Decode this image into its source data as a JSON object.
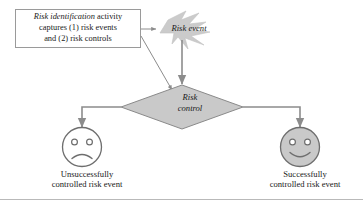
{
  "diagram": {
    "description_box": {
      "line1_italic": "Risk identification",
      "line1_rest": " activity",
      "line2": "captures (1) risk events",
      "line3": "and (2) risk controls"
    },
    "risk_event": {
      "label": "Risk event",
      "shape": "lightning-burst"
    },
    "risk_control": {
      "label_line1": "Risk",
      "label_line2": "control",
      "shape": "diamond"
    },
    "outcomes": [
      {
        "face": "sad-face",
        "caption_line1": "Unsuccessfully",
        "caption_line2": "controlled risk event"
      },
      {
        "face": "happy-face",
        "caption_line1": "Successfully",
        "caption_line2": "controlled risk event"
      }
    ],
    "colors": {
      "shape_fill": "#c9c9c9",
      "shape_stroke": "#8a8a8a",
      "connector": "#8c8c8c",
      "box_stroke": "#9a9a9a",
      "text": "#1a1a1a",
      "rule": "#b9b9b9",
      "sad_face_fill": "#ffffff",
      "happy_face_fill": "#c9c9c9"
    }
  }
}
